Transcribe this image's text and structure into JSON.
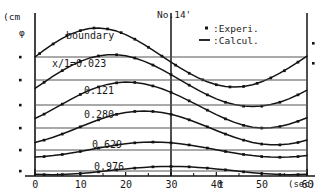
{
  "chart_data": {
    "type": "line",
    "title": "No.14'",
    "xlabel": "t",
    "xunit": "(sec)",
    "ylabel": "φ",
    "yunit": "(cm",
    "xlim": [
      0,
      60
    ],
    "xticks": [
      0,
      10,
      20,
      30,
      40,
      50,
      60
    ],
    "xticklabels": [
      "0",
      "10",
      "20",
      "30",
      "40",
      "50",
      "60"
    ],
    "grid": false,
    "legend_position": "top-right",
    "legend": [
      {
        "marker": "dot",
        "symbol": "•",
        "separator": ":",
        "label": "Experi."
      },
      {
        "marker": "line",
        "symbol": "—",
        "separator": ":",
        "label": "Calcul."
      }
    ],
    "vertical_reference_lines": [
      30,
      60
    ],
    "y_axis_tick_count": 6,
    "annotations": [
      "boundary",
      "x/l=0.023",
      "0.121",
      "0.280",
      "0.629",
      "0.976"
    ],
    "series": [
      {
        "name": "boundary",
        "label": "boundary",
        "baseline_y": 57,
        "amplitude": 33,
        "phase_deg": 0,
        "period": 60,
        "x": [
          0,
          2,
          4,
          6,
          8,
          10,
          12,
          14,
          16,
          18,
          20,
          22,
          24,
          26,
          28,
          30,
          32,
          34,
          36,
          38,
          40,
          42,
          44,
          46,
          48,
          50,
          52,
          54,
          56,
          58,
          60
        ],
        "values": [
          0.0,
          6.8,
          13.1,
          18.6,
          23.1,
          26.4,
          28.4,
          29.0,
          28.1,
          25.9,
          22.4,
          17.9,
          12.6,
          6.8,
          0.9,
          -5.1,
          -10.9,
          -16.2,
          -20.9,
          -24.8,
          -27.7,
          -29.4,
          -30.0,
          -29.4,
          -27.7,
          -24.8,
          -20.9,
          -16.2,
          -10.9,
          -5.1,
          0.9
        ],
        "marker_x": [
          1,
          4,
          7,
          10,
          13,
          16,
          19,
          22,
          25,
          28,
          31,
          34,
          37,
          40,
          43,
          46,
          49,
          52,
          55,
          58
        ],
        "marker_values": [
          3.5,
          13.1,
          21.5,
          26.4,
          29.0,
          28.1,
          24.4,
          17.9,
          9.8,
          0.9,
          -8.1,
          -16.2,
          -22.8,
          -27.7,
          -29.9,
          -29.4,
          -26.3,
          -20.9,
          -13.7,
          -5.1
        ]
      },
      {
        "name": "x/l=0.023",
        "label": "x/1=0.023",
        "baseline_y": 80,
        "amplitude": 27,
        "phase_deg": 18,
        "period": 60,
        "x": [
          0,
          2,
          4,
          6,
          8,
          10,
          12,
          14,
          16,
          18,
          20,
          22,
          24,
          26,
          28,
          30,
          32,
          34,
          36,
          38,
          40,
          42,
          44,
          46,
          48,
          50,
          52,
          54,
          56,
          58,
          60
        ],
        "values": [
          -8.3,
          -2.3,
          3.8,
          9.4,
          14.4,
          18.6,
          21.9,
          24.1,
          25.3,
          25.3,
          24.2,
          22.0,
          18.9,
          15.0,
          10.4,
          5.4,
          0.2,
          -5.1,
          -10.2,
          -14.8,
          -18.9,
          -22.2,
          -24.6,
          -26.1,
          -26.6,
          -26.1,
          -24.6,
          -22.2,
          -18.9,
          -14.8,
          -10.2
        ]
      },
      {
        "name": "0.121",
        "label": "0.121",
        "baseline_y": 105,
        "amplitude": 23,
        "phase_deg": 36,
        "period": 60,
        "x": [
          0,
          2,
          4,
          6,
          8,
          10,
          12,
          14,
          16,
          18,
          20,
          22,
          24,
          26,
          28,
          30,
          32,
          34,
          36,
          38,
          40,
          42,
          44,
          46,
          48,
          50,
          52,
          54,
          56,
          58,
          60
        ],
        "values": [
          -13.5,
          -9.1,
          -4.2,
          0.9,
          5.9,
          10.6,
          14.7,
          18.1,
          20.6,
          22.2,
          22.9,
          22.6,
          21.3,
          19.1,
          16.2,
          12.6,
          8.6,
          4.2,
          -0.4,
          -5.1,
          -9.6,
          -13.8,
          -17.4,
          -20.3,
          -22.2,
          -23.0,
          -22.8,
          -21.5,
          -19.3,
          -16.3,
          -12.7
        ]
      },
      {
        "name": "0.280",
        "label": "0.280",
        "baseline_y": 128,
        "amplitude": 17,
        "phase_deg": 58,
        "period": 60,
        "x": [
          0,
          2,
          4,
          6,
          8,
          10,
          12,
          14,
          16,
          18,
          20,
          22,
          24,
          26,
          28,
          30,
          32,
          34,
          36,
          38,
          40,
          42,
          44,
          46,
          48,
          50,
          52,
          54,
          56,
          58,
          60
        ],
        "values": [
          -14.4,
          -12.1,
          -9.3,
          -6.0,
          -2.5,
          1.2,
          4.8,
          8.2,
          11.2,
          13.7,
          15.5,
          16.6,
          17.0,
          16.6,
          15.5,
          13.7,
          11.2,
          8.2,
          4.8,
          1.2,
          -2.5,
          -6.0,
          -9.3,
          -12.1,
          -14.4,
          -16.0,
          -16.8,
          -16.8,
          -16.0,
          -14.4,
          -12.1
        ]
      },
      {
        "name": "0.629",
        "label": "0.629",
        "baseline_y": 150,
        "amplitude": 8,
        "phase_deg": 95,
        "period": 60,
        "x": [
          0,
          2,
          4,
          6,
          8,
          10,
          12,
          14,
          16,
          18,
          20,
          22,
          24,
          26,
          28,
          30,
          32,
          34,
          36,
          38,
          40,
          42,
          44,
          46,
          48,
          50,
          52,
          54,
          56,
          58,
          60
        ],
        "values": [
          -7.0,
          -6.5,
          -5.6,
          -4.4,
          -3.0,
          -1.4,
          0.3,
          2.0,
          3.6,
          5.1,
          6.3,
          7.2,
          7.8,
          8.0,
          7.8,
          7.2,
          6.3,
          5.1,
          3.6,
          2.0,
          0.3,
          -1.4,
          -3.0,
          -4.4,
          -5.6,
          -6.5,
          -7.0,
          -7.2,
          -7.0,
          -6.5,
          -5.6
        ]
      },
      {
        "name": "0.976",
        "label": "0.976",
        "baseline_y": 171,
        "amplitude": 5,
        "phase_deg": 120,
        "period": 60,
        "x": [
          0,
          2,
          4,
          6,
          8,
          10,
          12,
          14,
          16,
          18,
          20,
          22,
          24,
          26,
          28,
          30,
          32,
          34,
          36,
          38,
          40,
          42,
          44,
          46,
          48,
          50,
          52,
          54,
          56,
          58,
          60
        ],
        "values": [
          -3.3,
          -3.6,
          -3.7,
          -3.5,
          -3.1,
          -2.5,
          -1.7,
          -0.8,
          0.2,
          1.2,
          2.1,
          2.9,
          3.6,
          4.2,
          4.5,
          4.6,
          4.5,
          4.2,
          3.6,
          2.9,
          2.1,
          1.2,
          0.2,
          -0.8,
          -1.7,
          -2.5,
          -3.1,
          -3.5,
          -3.7,
          -3.6,
          -3.3
        ]
      }
    ]
  },
  "axes": {
    "y_unit_label": "(cm",
    "y_symbol": "φ",
    "x_var_label": "t",
    "x_unit_label": "(sec)",
    "origin_label": "0",
    "xticklabels": [
      "0",
      "10",
      "20",
      "30",
      "40",
      "50",
      "60"
    ]
  },
  "title": "No.14'",
  "legend": {
    "experi_symbol": "▪",
    "experi_sep": ":Experi.",
    "calcul_symbol": "—",
    "calcul_sep": ":Calcul."
  },
  "curve_labels": {
    "boundary": "boundary",
    "c1": "x/1=0.023",
    "c2": "0.121",
    "c3": "0.280",
    "c4": "0.629",
    "c5": "0.976"
  },
  "colors": {
    "ink": "#141414",
    "baseline": "#555555",
    "background": "#ffffff"
  }
}
